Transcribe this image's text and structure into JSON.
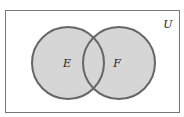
{
  "diagram": {
    "type": "venn",
    "universe_label": "U",
    "sets": [
      {
        "label": "E",
        "cx": 68,
        "cy": 63,
        "r": 36
      },
      {
        "label": "F",
        "cx": 119,
        "cy": 63,
        "r": 36
      }
    ],
    "colors": {
      "fill": "#d6d6d6",
      "stroke": "#666666",
      "frame": "#777777"
    }
  }
}
